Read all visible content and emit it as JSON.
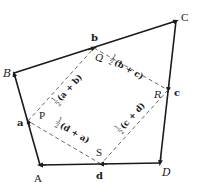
{
  "diagram": {
    "vertices": {
      "A": {
        "label": "A",
        "x": 40,
        "y": 165
      },
      "B": {
        "label": "B",
        "x": 14,
        "y": 73
      },
      "C": {
        "label": "C",
        "x": 176,
        "y": 21
      },
      "D": {
        "label": "D",
        "x": 160,
        "y": 163
      }
    },
    "edges": [
      {
        "from": "A",
        "to": "B",
        "vector": "a"
      },
      {
        "from": "B",
        "to": "C",
        "vector": "b"
      },
      {
        "from": "C",
        "to": "D",
        "vector": "c"
      },
      {
        "from": "D",
        "to": "A",
        "vector": "d"
      }
    ],
    "edge_labels": {
      "a": "a",
      "b": "b",
      "c": "c",
      "d": "d"
    },
    "midpoints": {
      "P": {
        "label": "P",
        "x": 28,
        "y": 121
      },
      "Q": {
        "label": "Q",
        "x": 94,
        "y": 48
      },
      "R": {
        "label": "R",
        "x": 168,
        "y": 90
      },
      "S": {
        "label": "S",
        "x": 101,
        "y": 164
      }
    },
    "midpoint_segments": [
      {
        "from": "P",
        "to": "Q",
        "expr": "(a + b)",
        "coef": "1/2"
      },
      {
        "from": "Q",
        "to": "R",
        "expr": "(b + c)",
        "coef": "1/2"
      },
      {
        "from": "R",
        "to": "S",
        "expr": "(c + d)",
        "coef": "1/2"
      },
      {
        "from": "S",
        "to": "P",
        "expr": "(d + a)",
        "coef": "1/2"
      }
    ],
    "colors": {
      "edge": "#1a1a1a",
      "dashed": "#555555",
      "background": "#ffffff"
    }
  }
}
